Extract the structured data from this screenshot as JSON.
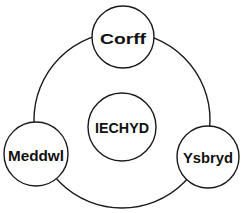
{
  "diagram": {
    "type": "cycle",
    "center": {
      "label": "IECHYD"
    },
    "nodes": [
      {
        "id": "corff",
        "label": "Corff"
      },
      {
        "id": "meddwl",
        "label": "Meddwl"
      },
      {
        "id": "ysbryd",
        "label": "Ysbryd"
      }
    ],
    "colors": {
      "stroke": "#1a1a1a",
      "fill": "#ffffff",
      "text": "#111111"
    }
  }
}
